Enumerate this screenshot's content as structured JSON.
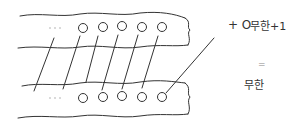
{
  "diagram": {
    "type": "hand-drawn bijection sketch",
    "top_band": {
      "ellipsis": "...",
      "circle_count": 5
    },
    "bottom_band": {
      "ellipsis": "...",
      "circle_count": 5
    },
    "extra_element_label": "+ O",
    "connection_count": 6
  },
  "equation": {
    "left": "무한+1",
    "operator": "=",
    "right": "무한"
  },
  "colors": {
    "stroke": "#333333",
    "dots": "#aaaaaa",
    "background": "#ffffff"
  }
}
